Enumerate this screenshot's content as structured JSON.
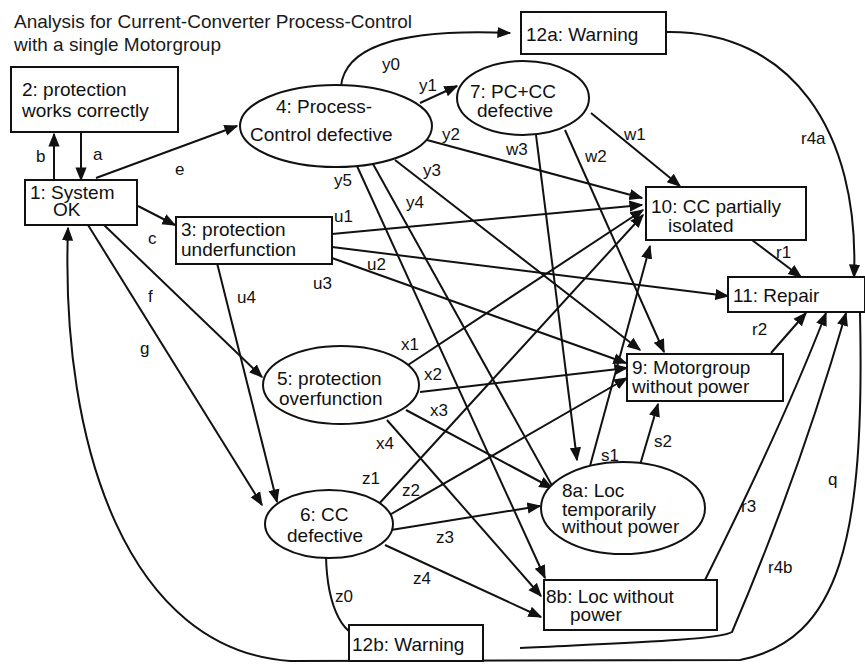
{
  "title": {
    "line1": "Analysis for Current-Converter Process-Control",
    "line2": "with a single Motorgroup"
  },
  "nodes": {
    "n1": {
      "id": "1",
      "shape": "rect",
      "lines": [
        "1: System",
        "OK"
      ]
    },
    "n2": {
      "id": "2",
      "shape": "rect",
      "lines": [
        "2: protection",
        "works correctly"
      ]
    },
    "n3": {
      "id": "3",
      "shape": "rect",
      "lines": [
        "3: protection",
        "underfunction"
      ]
    },
    "n4": {
      "id": "4",
      "shape": "ellipse",
      "lines": [
        "4: Process-",
        "Control defective"
      ]
    },
    "n5": {
      "id": "5",
      "shape": "ellipse",
      "lines": [
        "5: protection",
        "overfunction"
      ]
    },
    "n6": {
      "id": "6",
      "shape": "ellipse",
      "lines": [
        "6: CC",
        "defective"
      ]
    },
    "n7": {
      "id": "7",
      "shape": "ellipse",
      "lines": [
        "7: PC+CC",
        "defective"
      ]
    },
    "n8a": {
      "id": "8a",
      "shape": "ellipse",
      "lines": [
        "8a: Loc",
        "temporarily",
        "without power"
      ]
    },
    "n8b": {
      "id": "8b",
      "shape": "rect",
      "lines": [
        "8b: Loc without",
        "power"
      ]
    },
    "n9": {
      "id": "9",
      "shape": "rect",
      "lines": [
        "9: Motorgroup",
        "without power"
      ]
    },
    "n10": {
      "id": "10",
      "shape": "rect",
      "lines": [
        "10: CC partially",
        "isolated"
      ]
    },
    "n11": {
      "id": "11",
      "shape": "rect",
      "lines": [
        "11: Repair"
      ]
    },
    "n12a": {
      "id": "12a",
      "shape": "rect",
      "lines": [
        "12a: Warning"
      ]
    },
    "n12b": {
      "id": "12b",
      "shape": "rect",
      "lines": [
        "12b: Warning"
      ]
    }
  },
  "edges": {
    "a": {
      "label": "a",
      "from": "2",
      "to": "1"
    },
    "b": {
      "label": "b",
      "from": "1",
      "to": "2"
    },
    "e": {
      "label": "e",
      "from": "1",
      "to": "4"
    },
    "c": {
      "label": "c",
      "from": "1",
      "to": "3"
    },
    "f": {
      "label": "f",
      "from": "1",
      "to": "5"
    },
    "g": {
      "label": "g",
      "from": "1",
      "to": "6"
    },
    "y0": {
      "label": "y0",
      "from": "4",
      "to": "12a"
    },
    "y1": {
      "label": "y1",
      "from": "4",
      "to": "7"
    },
    "y2": {
      "label": "y2",
      "from": "4",
      "to": "10"
    },
    "y3": {
      "label": "y3",
      "from": "4",
      "to": "9"
    },
    "y4": {
      "label": "y4",
      "from": "4",
      "to": "8a"
    },
    "y5": {
      "label": "y5",
      "from": "4",
      "to": "8b"
    },
    "w1": {
      "label": "w1",
      "from": "7",
      "to": "10"
    },
    "w2": {
      "label": "w2",
      "from": "7",
      "to": "9"
    },
    "w3": {
      "label": "w3",
      "from": "7",
      "to": "8a"
    },
    "u1": {
      "label": "u1",
      "from": "3",
      "to": "10"
    },
    "u2": {
      "label": "u2",
      "from": "3",
      "to": "11"
    },
    "u3": {
      "label": "u3",
      "from": "3",
      "to": "9"
    },
    "u4": {
      "label": "u4",
      "from": "3",
      "to": "6"
    },
    "x1": {
      "label": "x1",
      "from": "5",
      "to": "10"
    },
    "x2": {
      "label": "x2",
      "from": "5",
      "to": "9"
    },
    "x3": {
      "label": "x3",
      "from": "5",
      "to": "8a"
    },
    "x4": {
      "label": "x4",
      "from": "5",
      "to": "8b"
    },
    "z0": {
      "label": "z0",
      "from": "6",
      "to": "12b"
    },
    "z1": {
      "label": "z1",
      "from": "6",
      "to": "10"
    },
    "z2": {
      "label": "z2",
      "from": "6",
      "to": "9"
    },
    "z3": {
      "label": "z3",
      "from": "6",
      "to": "8a"
    },
    "z4": {
      "label": "z4",
      "from": "6",
      "to": "8b"
    },
    "s1": {
      "label": "s1",
      "from": "8a",
      "to": "10"
    },
    "s2": {
      "label": "s2",
      "from": "8a",
      "to": "9"
    },
    "r1": {
      "label": "r1",
      "from": "10",
      "to": "11"
    },
    "r2": {
      "label": "r2",
      "from": "9",
      "to": "11"
    },
    "r3": {
      "label": "r3",
      "from": "8b",
      "to": "11"
    },
    "r4a": {
      "label": "r4a",
      "from": "12a",
      "to": "11"
    },
    "r4b": {
      "label": "r4b",
      "from": "12b",
      "to": "11"
    },
    "q": {
      "label": "q",
      "from": "11",
      "to": "1"
    }
  }
}
